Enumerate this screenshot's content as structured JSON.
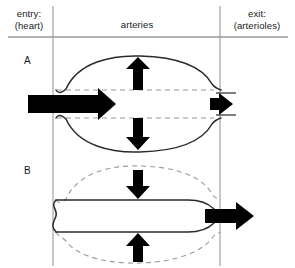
{
  "figure": {
    "width": 295,
    "height": 268,
    "background_color": "#ffffff",
    "line_color": "#2b2b2b",
    "guide_color": "#8c8c8c",
    "dash_color": "#9a9a9a",
    "arrow_color": "#000000"
  },
  "header": {
    "entry_label": "entry:\n(heart)",
    "middle_label": "arteries",
    "exit_label": "exit:\n(arterioles)",
    "separator_y": 37,
    "left_divider_x": 53,
    "right_divider_x": 220
  },
  "panels": [
    {
      "id": "A",
      "label": "A",
      "phase": "systole",
      "description": "Artery wall distends outward; large inflow from heart, small outflow to arterioles",
      "wall_style": "solid-bulged",
      "reference_style": "dashed-straight",
      "vessel_top_y": 90,
      "vessel_bottom_y": 118,
      "bulge_top_y": 57,
      "bulge_bottom_y": 150,
      "entry_arrow": {
        "direction": "right",
        "size": "large",
        "x_start": 28,
        "x_end": 108,
        "y": 104
      },
      "exit_arrow": {
        "direction": "right",
        "size": "small",
        "x_start": 212,
        "x_end": 236,
        "y": 104
      },
      "radial_arrows": [
        {
          "direction": "up",
          "x": 138,
          "y_start": 90,
          "y_end": 60
        },
        {
          "direction": "down",
          "x": 138,
          "y_start": 118,
          "y_end": 148
        }
      ]
    },
    {
      "id": "B",
      "label": "B",
      "phase": "diastole",
      "description": "Artery wall recoils inward; no inflow from heart, large outflow to arterioles",
      "wall_style": "solid-straight",
      "reference_style": "dashed-bulged",
      "vessel_top_y": 200,
      "vessel_bottom_y": 232,
      "bulge_top_y": 168,
      "bulge_bottom_y": 262,
      "entry_arrow": null,
      "exit_arrow": {
        "direction": "right",
        "size": "large",
        "x_start": 208,
        "x_end": 252,
        "y": 216
      },
      "radial_arrows": [
        {
          "direction": "down",
          "x": 138,
          "y_start": 170,
          "y_end": 199
        },
        {
          "direction": "up",
          "x": 138,
          "y_start": 262,
          "y_end": 233
        }
      ]
    }
  ]
}
